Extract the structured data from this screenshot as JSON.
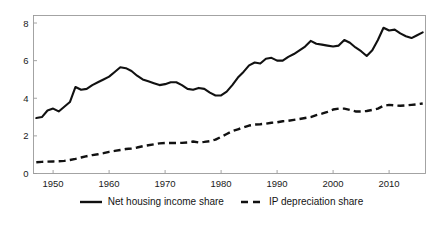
{
  "chart_data": {
    "type": "line",
    "title": "",
    "subtitle": "",
    "xlabel": "",
    "ylabel": "",
    "xlim": [
      1946.5,
      2016.5
    ],
    "ylim": [
      0,
      8.4
    ],
    "grid": false,
    "legend_position": "bottom-center",
    "xticks": [
      "1950",
      "1960",
      "1970",
      "1980",
      "1990",
      "2000",
      "2010"
    ],
    "xtick_values": [
      1950,
      1960,
      1970,
      1980,
      1990,
      2000,
      2010
    ],
    "yticks": [
      "0",
      "2",
      "4",
      "6",
      "8"
    ],
    "ytick_values": [
      0,
      2,
      4,
      6,
      8
    ],
    "x": [
      1947,
      1948,
      1949,
      1950,
      1951,
      1952,
      1953,
      1954,
      1955,
      1956,
      1957,
      1958,
      1959,
      1960,
      1961,
      1962,
      1963,
      1964,
      1965,
      1966,
      1967,
      1968,
      1969,
      1970,
      1971,
      1972,
      1973,
      1974,
      1975,
      1976,
      1977,
      1978,
      1979,
      1980,
      1981,
      1982,
      1983,
      1984,
      1985,
      1986,
      1987,
      1988,
      1989,
      1990,
      1991,
      1992,
      1993,
      1994,
      1995,
      1996,
      1997,
      1998,
      1999,
      2000,
      2001,
      2002,
      2003,
      2004,
      2005,
      2006,
      2007,
      2008,
      2009,
      2010,
      2011,
      2012,
      2013,
      2014,
      2015,
      2016
    ],
    "series": [
      {
        "name": "Net housing income share",
        "style": "solid",
        "color": "#111111",
        "values": [
          2.95,
          3.0,
          3.35,
          3.45,
          3.3,
          3.55,
          3.8,
          4.6,
          4.45,
          4.5,
          4.7,
          4.85,
          5.0,
          5.15,
          5.4,
          5.65,
          5.6,
          5.45,
          5.2,
          5.0,
          4.9,
          4.8,
          4.7,
          4.75,
          4.85,
          4.85,
          4.7,
          4.5,
          4.45,
          4.55,
          4.5,
          4.3,
          4.15,
          4.15,
          4.35,
          4.7,
          5.1,
          5.4,
          5.75,
          5.9,
          5.85,
          6.1,
          6.15,
          6.0,
          6.0,
          6.2,
          6.35,
          6.55,
          6.75,
          7.05,
          6.9,
          6.85,
          6.8,
          6.75,
          6.8,
          7.1,
          6.95,
          6.7,
          6.5,
          6.25,
          6.55,
          7.1,
          7.75,
          7.6,
          7.65,
          7.45,
          7.3,
          7.2,
          7.35,
          7.5
        ]
      },
      {
        "name": "IP depreciation share",
        "style": "dashed",
        "color": "#111111",
        "values": [
          0.6,
          0.62,
          0.63,
          0.64,
          0.65,
          0.67,
          0.72,
          0.78,
          0.85,
          0.92,
          0.98,
          1.02,
          1.08,
          1.15,
          1.2,
          1.25,
          1.3,
          1.33,
          1.38,
          1.45,
          1.5,
          1.55,
          1.6,
          1.62,
          1.62,
          1.62,
          1.63,
          1.65,
          1.7,
          1.65,
          1.68,
          1.72,
          1.8,
          1.95,
          2.1,
          2.25,
          2.35,
          2.45,
          2.55,
          2.6,
          2.62,
          2.65,
          2.7,
          2.72,
          2.78,
          2.8,
          2.85,
          2.9,
          2.95,
          3.0,
          3.1,
          3.18,
          3.28,
          3.4,
          3.45,
          3.45,
          3.38,
          3.3,
          3.3,
          3.32,
          3.38,
          3.45,
          3.6,
          3.65,
          3.62,
          3.6,
          3.62,
          3.65,
          3.68,
          3.72
        ]
      }
    ]
  },
  "legend": {
    "entries": [
      {
        "label": "Net housing income share",
        "style": "solid"
      },
      {
        "label": "IP depreciation share",
        "style": "dashed"
      }
    ]
  }
}
